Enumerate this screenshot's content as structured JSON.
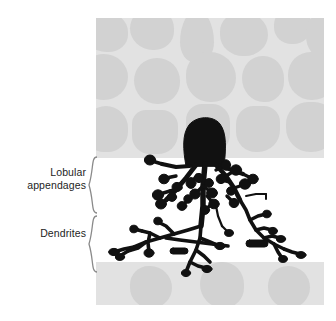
{
  "figure": {
    "type": "biological-diagram",
    "background_color": "#ffffff",
    "tissue_color": "#e2e2e2",
    "cell_blob_color": "#d2d2d2",
    "neuron_color": "#111111",
    "brace_color": "#8a8a8a",
    "text_color": "#1d1d1d"
  },
  "labels": {
    "lobular": "Lobular\nappendages",
    "dendrites": "Dendrites",
    "brace_glyph": "{"
  },
  "panel": {
    "bands": [
      {
        "name": "upper-cell-layer",
        "top": 0,
        "height": 140
      },
      {
        "name": "lower-cell-layer",
        "top": 244,
        "height": 43
      }
    ],
    "upper_blobs": [
      {
        "x": -14,
        "y": -6,
        "w": 46,
        "h": 40,
        "r": "48% 52% 44% 56%"
      },
      {
        "x": 34,
        "y": -10,
        "w": 44,
        "h": 42,
        "r": "50% 50% 46% 54%"
      },
      {
        "x": 84,
        "y": -8,
        "w": 34,
        "h": 52,
        "r": "50% 50% 40% 40% / 62% 62% 38% 38%"
      },
      {
        "x": 124,
        "y": -6,
        "w": 48,
        "h": 44,
        "r": "46% 54% 50% 50%"
      },
      {
        "x": 178,
        "y": -10,
        "w": 38,
        "h": 36,
        "r": "48% 52% 52% 48%"
      },
      {
        "x": 210,
        "y": -4,
        "w": 34,
        "h": 44,
        "r": "44% 56% 48% 52%"
      },
      {
        "x": -16,
        "y": 36,
        "w": 48,
        "h": 46,
        "r": "50% 50% 50% 50%"
      },
      {
        "x": 38,
        "y": 40,
        "w": 46,
        "h": 46,
        "r": "50% 50% 48% 52%"
      },
      {
        "x": 90,
        "y": 34,
        "w": 50,
        "h": 50,
        "r": "46% 54% 50% 50%"
      },
      {
        "x": 146,
        "y": 38,
        "w": 42,
        "h": 46,
        "r": "50% 50% 46% 54%"
      },
      {
        "x": 192,
        "y": 34,
        "w": 48,
        "h": 48,
        "r": "48% 52% 50% 50%"
      },
      {
        "x": -12,
        "y": 88,
        "w": 44,
        "h": 46,
        "r": "24px 24px 22px 22px"
      },
      {
        "x": 36,
        "y": 92,
        "w": 46,
        "h": 44,
        "r": "14px 16px 20px 18px"
      },
      {
        "x": 90,
        "y": 86,
        "w": 44,
        "h": 50,
        "r": "16px 18px 20px 20px"
      },
      {
        "x": 140,
        "y": 88,
        "w": 44,
        "h": 46,
        "r": "18px 16px 22px 20px"
      },
      {
        "x": 190,
        "y": 84,
        "w": 50,
        "h": 50,
        "r": "22px 22px 24px 24px"
      }
    ],
    "lower_blobs": [
      {
        "x": 34,
        "y": 4,
        "w": 42,
        "h": 42,
        "r": "46% 54% 50% 50%"
      },
      {
        "x": 104,
        "y": 0,
        "w": 44,
        "h": 46,
        "r": "50% 50% 46% 54%"
      },
      {
        "x": 172,
        "y": 4,
        "w": 42,
        "h": 42,
        "r": "48% 52% 50% 50%"
      }
    ]
  },
  "neuron": {
    "soma_label": "soma",
    "appendage_count": 22,
    "regions": [
      {
        "name": "soma",
        "top": 118,
        "bottom": 166
      },
      {
        "name": "lobular-appendages",
        "top": 160,
        "bottom": 215
      },
      {
        "name": "dendrites",
        "top": 215,
        "bottom": 272
      }
    ]
  }
}
